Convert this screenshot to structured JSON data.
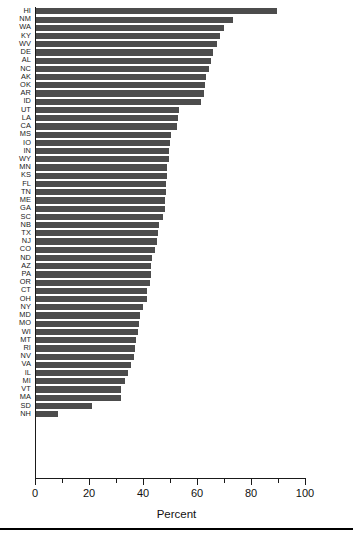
{
  "chart_data": {
    "type": "bar",
    "orientation": "horizontal",
    "title": "",
    "xlabel": "Percent",
    "ylabel": "",
    "xlim": [
      0,
      100
    ],
    "xticks": [
      0,
      20,
      40,
      60,
      80,
      100
    ],
    "xtick_labels": [
      "0",
      "20",
      "40",
      "60",
      "80",
      "100"
    ],
    "minor_xticks": [
      10,
      30,
      50,
      70,
      90
    ],
    "grid": false,
    "legend": null,
    "bar_color": "#4c4c4c",
    "axis_color": "#1a1a1a",
    "categories": [
      "HI",
      "NM",
      "WA",
      "KY",
      "WV",
      "DE",
      "AL",
      "NC",
      "AK",
      "OK",
      "AR",
      "ID",
      "UT",
      "LA",
      "CA",
      "MS",
      "IO",
      "IN",
      "WY",
      "MN",
      "KS",
      "FL",
      "TN",
      "ME",
      "GA",
      "SC",
      "NB",
      "TX",
      "NJ",
      "CO",
      "ND",
      "AZ",
      "PA",
      "OR",
      "CT",
      "OH",
      "NY",
      "MD",
      "MO",
      "WI",
      "MT",
      "RI",
      "NV",
      "VA",
      "IL",
      "MI",
      "VT",
      "MA",
      "SD",
      "NH"
    ],
    "values": [
      89.5,
      73.5,
      70.0,
      68.5,
      67.5,
      66.0,
      65.0,
      64.5,
      63.5,
      63.0,
      62.5,
      61.5,
      53.5,
      53.0,
      52.5,
      50.5,
      50.0,
      49.5,
      49.5,
      49.0,
      49.0,
      48.5,
      48.5,
      48.0,
      48.0,
      47.5,
      46.0,
      45.5,
      45.0,
      44.5,
      43.5,
      43.0,
      43.0,
      42.5,
      41.5,
      41.5,
      40.0,
      39.0,
      38.5,
      38.0,
      37.5,
      37.0,
      36.5,
      35.5,
      34.5,
      33.5,
      32.0,
      32.0,
      21.0,
      8.5
    ]
  }
}
